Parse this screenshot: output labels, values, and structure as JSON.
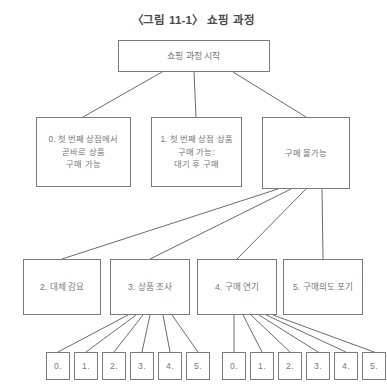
{
  "title": "〈그림 11-1〉 쇼핑 과정",
  "colors": {
    "box_border": "#7b7b7b",
    "box_fill": "#ffffff",
    "text": "#777777",
    "title_text": "#4a4a4a",
    "link_line": "#5a5a5a",
    "background": "#ffffff"
  },
  "nodes": {
    "root": {
      "label": "쇼핑 과정 시작",
      "x": 118,
      "y": 40,
      "w": 152,
      "h": 32
    },
    "level2": [
      {
        "id": "opt0",
        "label": "0. 첫 번째 상점에서\n곧바로 상품\n구매 가능",
        "x": 36,
        "y": 117,
        "w": 95,
        "h": 70
      },
      {
        "id": "opt1",
        "label": "1. 첫 번째 상점 상품\n구매 가능:\n대기 후 구매",
        "x": 151,
        "y": 117,
        "w": 91,
        "h": 70
      },
      {
        "id": "unavailable",
        "label": "구매 불가능",
        "x": 262,
        "y": 117,
        "w": 88,
        "h": 72
      }
    ],
    "level3": [
      {
        "id": "alt",
        "label": "2. 대체 감요",
        "x": 23,
        "y": 259,
        "w": 78,
        "h": 56
      },
      {
        "id": "research",
        "label": "3. 상품 조사",
        "x": 110,
        "y": 259,
        "w": 80,
        "h": 56
      },
      {
        "id": "delay",
        "label": "4. 구매 연기",
        "x": 197,
        "y": 259,
        "w": 80,
        "h": 56
      },
      {
        "id": "giveup",
        "label": "5. 구매의도 포기",
        "x": 283,
        "y": 259,
        "w": 80,
        "h": 56
      }
    ],
    "leaf_groups": [
      {
        "id": "leaves-research",
        "parent": "research",
        "items": [
          {
            "label": "0.",
            "x": 46,
            "y": 352,
            "w": 24,
            "h": 28
          },
          {
            "label": "1.",
            "x": 74,
            "y": 352,
            "w": 24,
            "h": 28
          },
          {
            "label": "2.",
            "x": 102,
            "y": 352,
            "w": 24,
            "h": 28
          },
          {
            "label": "3.",
            "x": 130,
            "y": 352,
            "w": 24,
            "h": 28
          },
          {
            "label": "4.",
            "x": 158,
            "y": 352,
            "w": 24,
            "h": 28
          },
          {
            "label": "5.",
            "x": 186,
            "y": 352,
            "w": 24,
            "h": 28
          }
        ]
      },
      {
        "id": "leaves-delay",
        "parent": "delay",
        "items": [
          {
            "label": "0.",
            "x": 222,
            "y": 352,
            "w": 24,
            "h": 28
          },
          {
            "label": "1.",
            "x": 250,
            "y": 352,
            "w": 24,
            "h": 28
          },
          {
            "label": "2.",
            "x": 278,
            "y": 352,
            "w": 24,
            "h": 28
          },
          {
            "label": "3.",
            "x": 306,
            "y": 352,
            "w": 24,
            "h": 28
          },
          {
            "label": "4.",
            "x": 334,
            "y": 352,
            "w": 24,
            "h": 28
          },
          {
            "label": "5.",
            "x": 362,
            "y": 352,
            "w": 24,
            "h": 28
          }
        ]
      }
    ]
  },
  "edges": [
    {
      "from": "root",
      "to": "opt0",
      "x1": 162,
      "y1": 72,
      "x2": 83,
      "y2": 117
    },
    {
      "from": "root",
      "to": "opt1",
      "x1": 194,
      "y1": 72,
      "x2": 196,
      "y2": 117
    },
    {
      "from": "root",
      "to": "unavailable",
      "x1": 233,
      "y1": 72,
      "x2": 306,
      "y2": 117
    },
    {
      "from": "unavailable",
      "to": "alt",
      "x1": 278,
      "y1": 189,
      "x2": 62,
      "y2": 259
    },
    {
      "from": "unavailable",
      "to": "research",
      "x1": 291,
      "y1": 189,
      "x2": 150,
      "y2": 259
    },
    {
      "from": "unavailable",
      "to": "delay",
      "x1": 306,
      "y1": 189,
      "x2": 237,
      "y2": 259
    },
    {
      "from": "unavailable",
      "to": "giveup",
      "x1": 322,
      "y1": 189,
      "x2": 323,
      "y2": 259
    },
    {
      "from": "research",
      "to": "r0",
      "x1": 128,
      "y1": 315,
      "x2": 58,
      "y2": 352
    },
    {
      "from": "research",
      "to": "r1",
      "x1": 136,
      "y1": 315,
      "x2": 86,
      "y2": 352
    },
    {
      "from": "research",
      "to": "r2",
      "x1": 143,
      "y1": 315,
      "x2": 114,
      "y2": 352
    },
    {
      "from": "research",
      "to": "r3",
      "x1": 150,
      "y1": 315,
      "x2": 142,
      "y2": 352
    },
    {
      "from": "research",
      "to": "r4",
      "x1": 163,
      "y1": 315,
      "x2": 170,
      "y2": 352
    },
    {
      "from": "research",
      "to": "r5",
      "x1": 172,
      "y1": 315,
      "x2": 198,
      "y2": 352
    },
    {
      "from": "delay",
      "to": "d0",
      "x1": 234,
      "y1": 315,
      "x2": 234,
      "y2": 352
    },
    {
      "from": "delay",
      "to": "d1",
      "x1": 243,
      "y1": 315,
      "x2": 262,
      "y2": 352
    },
    {
      "from": "delay",
      "to": "d2",
      "x1": 251,
      "y1": 315,
      "x2": 290,
      "y2": 352
    },
    {
      "from": "delay",
      "to": "d3",
      "x1": 259,
      "y1": 315,
      "x2": 318,
      "y2": 352
    },
    {
      "from": "delay",
      "to": "d4",
      "x1": 266,
      "y1": 315,
      "x2": 346,
      "y2": 352
    },
    {
      "from": "delay",
      "to": "d5",
      "x1": 273,
      "y1": 315,
      "x2": 374,
      "y2": 352
    }
  ]
}
